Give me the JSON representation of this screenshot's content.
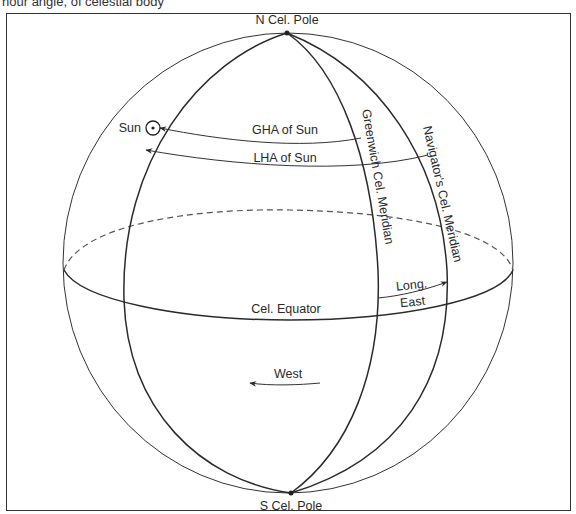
{
  "caption": "hour angle, of celestial body",
  "diagram": {
    "type": "celestial-sphere",
    "labels": {
      "north_pole": "N Cel. Pole",
      "south_pole": "S Cel. Pole",
      "sun": "Sun",
      "gha": "GHA of Sun",
      "lha": "LHA of Sun",
      "greenwich_meridian": "Greenwich Cel. Meridian",
      "navigator_meridian": "Navigator's Cel. Meridian",
      "equator": "Cel. Equator",
      "longitude_top": "Long.",
      "longitude_bottom": "East",
      "west": "West"
    },
    "colors": {
      "line": "#2b2b2b",
      "background": "#ffffff",
      "frame": "#333333"
    }
  }
}
